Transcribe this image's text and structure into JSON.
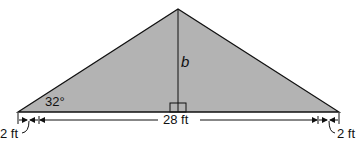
{
  "diagram": {
    "type": "isosceles-triangle-roof",
    "fill_color": "#b3b3b3",
    "stroke_color": "#111111",
    "labels": {
      "angle": "32°",
      "height": "b",
      "base_span": "28 ft",
      "left_overhang": "2 ft",
      "right_overhang": "2 ft"
    }
  }
}
